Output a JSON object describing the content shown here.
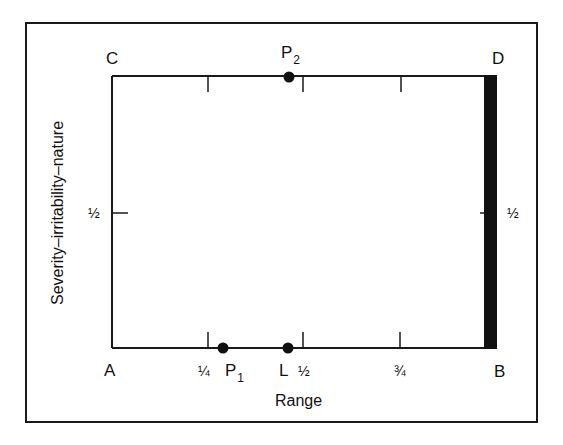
{
  "diagram": {
    "type": "severity-range-box-plot",
    "x_axis_label": "Range",
    "y_axis_label": "Severity–irritability–nature",
    "corners": {
      "top_left": "C",
      "top_right": "D",
      "bottom_left": "A",
      "bottom_right": "B"
    },
    "x_ticks": [
      "¼",
      "½",
      "¾"
    ],
    "y_ticks_left": [
      "½"
    ],
    "y_ticks_right": [
      "½"
    ],
    "points": [
      {
        "name": "P",
        "sub": "1",
        "position": "bottom edge, just right of ¼"
      },
      {
        "name": "L",
        "sub": "",
        "position": "bottom edge, just left of ½"
      },
      {
        "name": "P",
        "sub": "2",
        "position": "top edge, just left of ½"
      }
    ],
    "highlighted_edge": "B–D (right edge, thick black bar)",
    "colors": {
      "line": "#1a1a1a",
      "background": "#ffffff"
    }
  }
}
